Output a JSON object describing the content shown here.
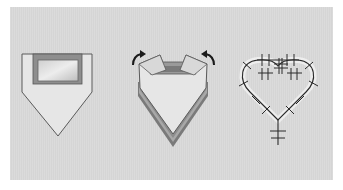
{
  "figure": {
    "type": "surgical-procedure-illustration",
    "steps": [
      {
        "id": 1,
        "description": "pentagon-shaped graft with rectangular window cut out at top"
      },
      {
        "id": 2,
        "description": "graft with flaps folded upward (curved arrows indicate folding direction)"
      },
      {
        "id": 3,
        "description": "heart-shaped closure secured with interrupted sutures"
      }
    ]
  },
  "colors": {
    "background": "#d9d9d9",
    "outline": "#555555",
    "fill_light": "#e8e8e8",
    "fill_mid": "#9a9a9a",
    "fill_dark": "#6e6e6e",
    "suture": "#2a2a2a",
    "arrow": "#1a1a1a"
  },
  "icons": [
    "curved-arrow-left-icon",
    "curved-arrow-right-icon"
  ]
}
